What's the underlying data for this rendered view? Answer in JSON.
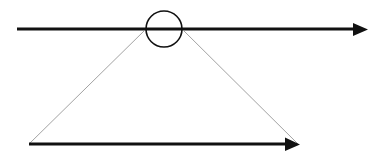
{
  "diagram": {
    "colors": {
      "stroke": "#111111",
      "thin_line": "#8a8a8a",
      "background": "#ffffff"
    },
    "elements": [
      {
        "name": "top-arrow",
        "kind": "arrow"
      },
      {
        "name": "circle-marker",
        "kind": "circle"
      },
      {
        "name": "left-projection-line",
        "kind": "line"
      },
      {
        "name": "right-projection-line",
        "kind": "line"
      },
      {
        "name": "bottom-arrow",
        "kind": "arrow"
      }
    ]
  }
}
